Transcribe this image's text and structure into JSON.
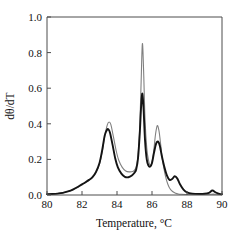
{
  "chart_data": {
    "type": "line",
    "title": "",
    "subtitle": "",
    "xlabel": "Temperature, °C",
    "ylabel": "dθ/dT",
    "xlim": [
      80,
      90
    ],
    "ylim": [
      0.0,
      1.0
    ],
    "xticks": [
      80,
      82,
      84,
      86,
      88,
      90
    ],
    "xtick_labels": [
      "80",
      "82",
      "84",
      "86",
      "88",
      "90"
    ],
    "yticks": [
      0.0,
      0.2,
      0.4,
      0.6,
      0.8,
      1.0
    ],
    "ytick_labels": [
      "0.0",
      "0.2",
      "0.4",
      "0.6",
      "0.8",
      "1.0"
    ],
    "grid": false,
    "legend": null,
    "legend_position": "none",
    "annotations": [],
    "series": [
      {
        "name": "gray-curve",
        "color": "#808080",
        "width": 1.1,
        "peaks": [
          {
            "x": 83.55,
            "y": 0.41
          },
          {
            "x": 85.45,
            "y": 0.85
          },
          {
            "x": 86.3,
            "y": 0.39
          }
        ],
        "x": [
          80.0,
          80.3,
          80.6,
          80.9,
          81.2,
          81.5,
          81.8,
          82.0,
          82.2,
          82.4,
          82.6,
          82.8,
          83.0,
          83.15,
          83.3,
          83.45,
          83.55,
          83.65,
          83.8,
          83.95,
          84.1,
          84.3,
          84.5,
          84.7,
          84.9,
          85.0,
          85.1,
          85.2,
          85.3,
          85.38,
          85.45,
          85.52,
          85.6,
          85.7,
          85.8,
          85.9,
          86.0,
          86.1,
          86.2,
          86.3,
          86.4,
          86.5,
          86.6,
          86.75,
          86.9,
          87.05,
          87.2,
          87.35,
          87.5,
          87.7,
          87.9,
          88.2,
          88.6,
          89.0,
          89.3,
          89.5,
          89.7,
          90.0
        ],
        "y": [
          0.005,
          0.006,
          0.008,
          0.012,
          0.02,
          0.03,
          0.045,
          0.058,
          0.07,
          0.082,
          0.098,
          0.125,
          0.175,
          0.24,
          0.33,
          0.395,
          0.41,
          0.395,
          0.325,
          0.25,
          0.195,
          0.155,
          0.135,
          0.13,
          0.132,
          0.14,
          0.16,
          0.22,
          0.38,
          0.64,
          0.85,
          0.7,
          0.43,
          0.265,
          0.195,
          0.168,
          0.185,
          0.25,
          0.34,
          0.39,
          0.36,
          0.28,
          0.195,
          0.115,
          0.062,
          0.032,
          0.018,
          0.01,
          0.006,
          0.004,
          0.003,
          0.003,
          0.003,
          0.003,
          0.004,
          0.005,
          0.004,
          0.003
        ]
      },
      {
        "name": "black-curve",
        "color": "#141414",
        "width": 1.9,
        "peaks": [
          {
            "x": 83.5,
            "y": 0.37
          },
          {
            "x": 85.45,
            "y": 0.57
          },
          {
            "x": 86.35,
            "y": 0.3
          },
          {
            "x": 87.3,
            "y": 0.105
          },
          {
            "x": 89.45,
            "y": 0.025
          }
        ],
        "x": [
          80.0,
          80.3,
          80.6,
          80.9,
          81.2,
          81.5,
          81.8,
          82.0,
          82.2,
          82.4,
          82.6,
          82.8,
          83.0,
          83.15,
          83.3,
          83.42,
          83.5,
          83.6,
          83.75,
          83.9,
          84.05,
          84.25,
          84.45,
          84.65,
          84.85,
          85.0,
          85.1,
          85.2,
          85.3,
          85.38,
          85.45,
          85.52,
          85.6,
          85.7,
          85.8,
          85.9,
          86.0,
          86.12,
          86.24,
          86.35,
          86.45,
          86.55,
          86.7,
          86.85,
          87.0,
          87.15,
          87.3,
          87.45,
          87.6,
          87.8,
          88.0,
          88.3,
          88.7,
          89.0,
          89.25,
          89.45,
          89.65,
          89.85,
          90.0
        ],
        "y": [
          0.005,
          0.006,
          0.008,
          0.012,
          0.02,
          0.032,
          0.048,
          0.06,
          0.072,
          0.085,
          0.1,
          0.13,
          0.18,
          0.25,
          0.335,
          0.365,
          0.37,
          0.35,
          0.28,
          0.205,
          0.155,
          0.12,
          0.102,
          0.1,
          0.11,
          0.125,
          0.145,
          0.205,
          0.345,
          0.5,
          0.57,
          0.48,
          0.31,
          0.2,
          0.165,
          0.16,
          0.18,
          0.24,
          0.29,
          0.3,
          0.275,
          0.225,
          0.16,
          0.11,
          0.085,
          0.09,
          0.105,
          0.092,
          0.06,
          0.03,
          0.015,
          0.008,
          0.006,
          0.007,
          0.012,
          0.025,
          0.014,
          0.006,
          0.004
        ]
      }
    ]
  }
}
